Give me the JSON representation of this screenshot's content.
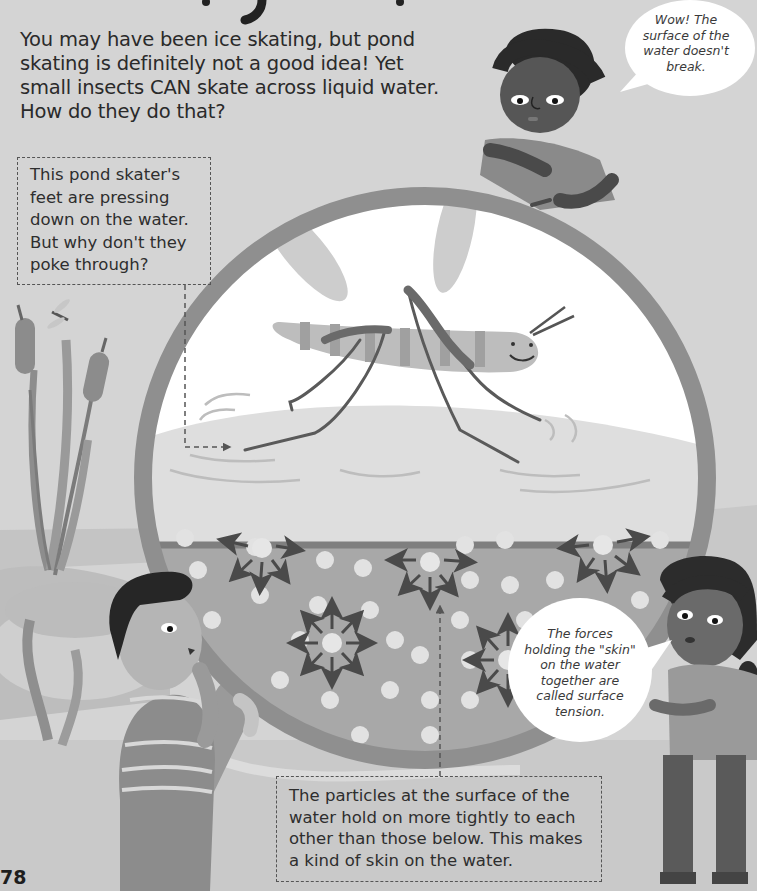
{
  "page": {
    "number": "78",
    "color_mode": "grayscale"
  },
  "intro_text": {
    "lines": [
      "You may have been ice skating, but pond",
      "skating is definitely not a good idea! Yet",
      "small insects CAN skate across liquid water.",
      "How do they do that?"
    ]
  },
  "callouts": {
    "feet": {
      "lines": [
        "This pond skater's",
        "feet are pressing",
        "down on the water.",
        "But why don't they",
        "poke through?"
      ]
    },
    "particles": {
      "lines": [
        "The particles at the surface of the",
        "water hold on more tightly to each",
        "other than those below. This makes",
        "a kind of skin on the water."
      ]
    }
  },
  "speech_bubbles": {
    "top_boy": {
      "lines": [
        "Wow! The",
        "surface of the",
        "water doesn't",
        "break."
      ]
    },
    "girl": {
      "lines": [
        "The forces",
        "holding the \"skin\"",
        "on the water",
        "together are",
        "called surface",
        "tension."
      ]
    }
  },
  "illustration": {
    "subject": "pond skater insect on water surface inside magnifying glass",
    "elements": [
      "magnifying-glass",
      "pond-skater",
      "water-particles",
      "force-arrows",
      "boy-top",
      "boy-left",
      "girl-right",
      "cattails",
      "dragonfly"
    ]
  },
  "colors": {
    "background": "#d4d4d4",
    "lens_sky": "#ffffff",
    "water_surface": "#dedede",
    "water_body": "#a8a8a8",
    "particle": "#e2e2e2",
    "ring": "#8f8f8f",
    "arrow": "#4a4a4a",
    "text": "#2a2a2a"
  }
}
